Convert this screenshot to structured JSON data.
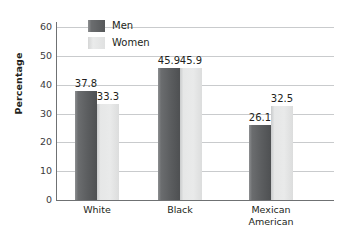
{
  "chart_data": {
    "type": "bar",
    "title": "",
    "subtitle": "",
    "xlabel": "",
    "ylabel": "Percentage",
    "ylim": [
      0,
      60
    ],
    "yticks": [
      0,
      10,
      20,
      30,
      40,
      50,
      60
    ],
    "ytick_labels": [
      "0",
      "10",
      "20",
      "30",
      "40",
      "50",
      "60"
    ],
    "grid": "horizontal",
    "legend_position": "upper-left-inside",
    "categories": [
      "White",
      "Black",
      "Mexican American"
    ],
    "category_labels": [
      "White",
      "Black",
      "Mexican\nAmerican"
    ],
    "series": [
      {
        "name": "Men",
        "color": "#5c5e60",
        "values": [
          37.8,
          45.9,
          26.1
        ],
        "value_labels": [
          "37.8",
          "45.9",
          "26.1"
        ]
      },
      {
        "name": "Women",
        "color": "#e6e7e7",
        "values": [
          33.3,
          45.9,
          32.5
        ],
        "value_labels": [
          "33.3",
          "45.9",
          "32.5"
        ]
      }
    ]
  },
  "legend": {
    "items": [
      {
        "label": "Men",
        "swatch": "men"
      },
      {
        "label": "Women",
        "swatch": "women"
      }
    ]
  },
  "colors": {
    "axis": "#6f7173",
    "grid": "#c9cbcd",
    "text": "#231f20",
    "background": "#ffffff"
  }
}
